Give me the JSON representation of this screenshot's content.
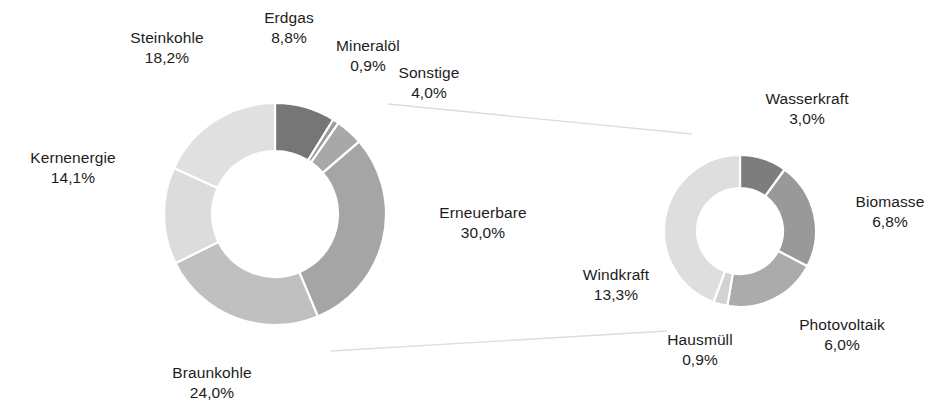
{
  "chart_data": {
    "type": "pie",
    "title": "",
    "subtitle": "",
    "xlabel": "",
    "ylabel": "",
    "legend_position": "none",
    "grid": false,
    "charts": [
      {
        "name": "Strommix gesamt",
        "type": "pie",
        "variant": "donut",
        "center": [
          275,
          214
        ],
        "outer_radius": 111,
        "inner_radius": 63,
        "start_angle_deg": 0,
        "direction": "clockwise",
        "categories": [
          "Erdgas",
          "Mineralöl",
          "Sonstige",
          "Erneuerbare",
          "Braunkohle",
          "Kernenergie",
          "Steinkohle"
        ],
        "values": [
          8.8,
          0.9,
          4.0,
          30.0,
          24.0,
          14.1,
          18.2
        ],
        "value_labels": [
          "8,8%",
          "0,9%",
          "4,0%",
          "30,0%",
          "24,0%",
          "14,1%",
          "18,2%"
        ],
        "colors": [
          "#767676",
          "#9a9a9a",
          "#a8a8a8",
          "#a5a5a5",
          "#c0c0c0",
          "#dcdcdc",
          "#e0e0e0"
        ],
        "slices": [
          {
            "label": "Erdgas",
            "value": 8.8,
            "value_label": "8,8%",
            "color": "#767676"
          },
          {
            "label": "Mineralöl",
            "value": 0.9,
            "value_label": "0,9%",
            "color": "#9a9a9a"
          },
          {
            "label": "Sonstige",
            "value": 4.0,
            "value_label": "4,0%",
            "color": "#a8a8a8"
          },
          {
            "label": "Erneuerbare",
            "value": 30.0,
            "value_label": "30,0%",
            "color": "#a5a5a5"
          },
          {
            "label": "Braunkohle",
            "value": 24.0,
            "value_label": "24,0%",
            "color": "#c0c0c0"
          },
          {
            "label": "Kernenergie",
            "value": 14.1,
            "value_label": "14,1%",
            "color": "#dcdcdc"
          },
          {
            "label": "Steinkohle",
            "value": 18.2,
            "value_label": "18,2%",
            "color": "#e0e0e0"
          }
        ]
      },
      {
        "name": "Erneuerbare Aufschlüsselung",
        "type": "pie",
        "variant": "donut",
        "center": [
          740,
          231
        ],
        "outer_radius": 76,
        "inner_radius": 43,
        "start_angle_deg": 0,
        "direction": "clockwise",
        "categories": [
          "Wasserkraft",
          "Biomasse",
          "Photovoltaik",
          "Hausmüll",
          "Windkraft"
        ],
        "values": [
          3.0,
          6.8,
          6.0,
          0.9,
          13.3
        ],
        "value_labels": [
          "3,0%",
          "6,8%",
          "6,0%",
          "0,9%",
          "13,3%"
        ],
        "colors": [
          "#7d7d7d",
          "#999999",
          "#ababab",
          "#d2d2d2",
          "#dedede"
        ],
        "slices": [
          {
            "label": "Wasserkraft",
            "value": 3.0,
            "value_label": "3,0%",
            "color": "#7d7d7d"
          },
          {
            "label": "Biomasse",
            "value": 6.8,
            "value_label": "6,8%",
            "color": "#999999"
          },
          {
            "label": "Photovoltaik",
            "value": 6.0,
            "value_label": "6,0%",
            "color": "#ababab"
          },
          {
            "label": "Hausmüll",
            "value": 0.9,
            "value_label": "0,9%",
            "color": "#d2d2d2"
          },
          {
            "label": "Windkraft",
            "value": 13.3,
            "value_label": "13,3%",
            "color": "#dedede"
          }
        ]
      }
    ]
  },
  "main_chart": {
    "steinkohle": {
      "name": "Steinkohle",
      "value": "18,2%"
    },
    "erdgas": {
      "name": "Erdgas",
      "value": "8,8%"
    },
    "mineraloel": {
      "name": "Mineralöl",
      "value": "0,9%"
    },
    "sonstige": {
      "name": "Sonstige",
      "value": "4,0%"
    },
    "kernenergie": {
      "name": "Kernenergie",
      "value": "14,1%"
    },
    "erneuerbare": {
      "name": "Erneuerbare",
      "value": "30,0%"
    },
    "braunkohle": {
      "name": "Braunkohle",
      "value": "24,0%"
    }
  },
  "detail_chart": {
    "wasserkraft": {
      "name": "Wasserkraft",
      "value": "3,0%"
    },
    "biomasse": {
      "name": "Biomasse",
      "value": "6,8%"
    },
    "photovoltaik": {
      "name": "Photovoltaik",
      "value": "6,0%"
    },
    "hausmuell": {
      "name": "Hausmüll",
      "value": "0,9%"
    },
    "windkraft": {
      "name": "Windkraft",
      "value": "13,3%"
    }
  },
  "colors": {
    "background": "#ffffff",
    "text": "#1c1c1c",
    "slice_gap": "#ffffff",
    "connector": "#d8d8d8"
  }
}
